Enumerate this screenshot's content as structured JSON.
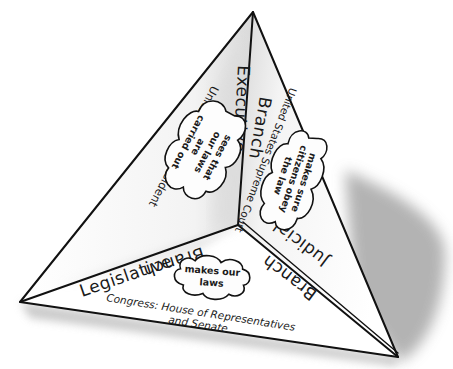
{
  "diagram": {
    "type": "tetrahedron-pyramid",
    "faces": [
      {
        "id": "executive",
        "branch_label": "Executive",
        "branch_suffix": "Branch",
        "who": "United States President",
        "role": "sees that our laws are carried out",
        "role_lines": [
          "sees that",
          "our laws",
          "are",
          "carried out"
        ]
      },
      {
        "id": "judicial",
        "branch_label": "Judicial",
        "branch_suffix": "Branch",
        "who": "United States Supreme Court",
        "role": "makes sure citizens obey the law",
        "role_lines": [
          "makes sure",
          "citizens obey",
          "the law"
        ]
      },
      {
        "id": "legislative",
        "branch_label": "Legislative",
        "branch_suffix": "Branch",
        "who": "Congress: House of Representatives and Senate",
        "who_lines": [
          "Congress: House of Representatives",
          "and Senate"
        ],
        "role": "makes our laws",
        "role_lines": [
          "makes our",
          "laws"
        ]
      }
    ]
  }
}
